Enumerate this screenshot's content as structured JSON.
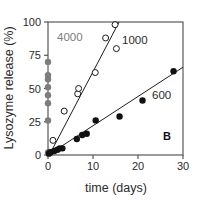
{
  "figure": {
    "panel_label": "B"
  },
  "axes": {
    "xlabel": "time (days)",
    "ylabel": "Lysozyme release (%)",
    "xticks": [
      "0",
      "10",
      "20",
      "30"
    ],
    "yticks": [
      "0",
      "25",
      "50",
      "75",
      "100"
    ]
  },
  "labels": {
    "series_4000": "4000",
    "series_1000": "1000",
    "series_600": "600"
  },
  "colors": {
    "gray_series": "#7d7d7d",
    "open_series": "#1a1a1a",
    "filled_series": "#111111",
    "axis": "#4a4a4a",
    "background": "#ffffff"
  },
  "chart_data": {
    "type": "scatter",
    "title": "",
    "xlabel": "time (days)",
    "ylabel": "Lysozyme release (%)",
    "xlim": [
      0,
      30
    ],
    "ylim": [
      0,
      100
    ],
    "xticks": [
      0,
      10,
      20,
      30
    ],
    "yticks": [
      0,
      25,
      50,
      75,
      100
    ],
    "grid": false,
    "legend": "inline-annotations",
    "annotations": [
      {
        "text": "4000",
        "x": 2.0,
        "y": 88,
        "color": "#7d7d7d"
      },
      {
        "text": "1000",
        "x": 16.5,
        "y": 86,
        "color": "#2a2a2a"
      },
      {
        "text": "600",
        "x": 23.0,
        "y": 45,
        "color": "#2a2a2a"
      },
      {
        "text": "B",
        "x": 25.5,
        "y": 14,
        "color": "#111111"
      }
    ],
    "series": [
      {
        "name": "4000",
        "marker": "filled-circle",
        "color": "#7d7d7d",
        "points": [
          {
            "x": 0.0,
            "y": 2
          },
          {
            "x": 0.0,
            "y": 26
          },
          {
            "x": 0.0,
            "y": 39
          },
          {
            "x": 0.0,
            "y": 45
          },
          {
            "x": 0.0,
            "y": 51
          },
          {
            "x": 0.0,
            "y": 57
          },
          {
            "x": 0.0,
            "y": 60
          },
          {
            "x": 0.0,
            "y": 70
          }
        ],
        "fit_line": null
      },
      {
        "name": "1000",
        "marker": "open-circle",
        "color": "#1a1a1a",
        "points": [
          {
            "x": 0.4,
            "y": 2
          },
          {
            "x": 1.1,
            "y": 11
          },
          {
            "x": 3.6,
            "y": 33
          },
          {
            "x": 6.6,
            "y": 46
          },
          {
            "x": 6.8,
            "y": 50
          },
          {
            "x": 10.5,
            "y": 62
          },
          {
            "x": 12.8,
            "y": 88
          },
          {
            "x": 14.9,
            "y": 98
          },
          {
            "x": 15.2,
            "y": 80
          }
        ],
        "fit_line": {
          "x0": 0.3,
          "y0": 0,
          "x1": 15.8,
          "y1": 100
        }
      },
      {
        "name": "600",
        "marker": "filled-circle",
        "color": "#111111",
        "points": [
          {
            "x": 0.2,
            "y": 1
          },
          {
            "x": 0.6,
            "y": 2
          },
          {
            "x": 1.4,
            "y": 3
          },
          {
            "x": 2.1,
            "y": 4
          },
          {
            "x": 2.6,
            "y": 5
          },
          {
            "x": 3.2,
            "y": 5
          },
          {
            "x": 6.4,
            "y": 12
          },
          {
            "x": 7.6,
            "y": 15
          },
          {
            "x": 8.6,
            "y": 16
          },
          {
            "x": 10.6,
            "y": 26
          },
          {
            "x": 15.9,
            "y": 29
          },
          {
            "x": 21.0,
            "y": 41
          },
          {
            "x": 27.9,
            "y": 63
          }
        ],
        "fit_line": {
          "x0": 0.0,
          "y0": 0,
          "x1": 30.0,
          "y1": 66
        }
      }
    ]
  }
}
